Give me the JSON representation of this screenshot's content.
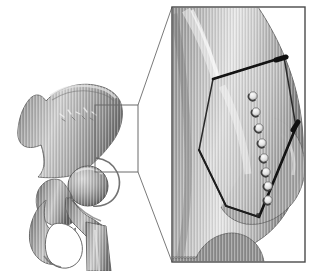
{
  "figure": {
    "title": "Periacetabular osteotomy of the hip",
    "background_color": "#ffffff",
    "width": 316,
    "height": 271,
    "panels": [
      {
        "id": "overview",
        "name": "pelvis-femur-overview",
        "caption": "Hemipelvis with proximal femur, lateral oblique view",
        "structures": [
          "ilium",
          "iliac-crest",
          "anterior-superior-iliac-spine",
          "acetabulum",
          "femoral-head",
          "femoral-neck",
          "greater-trochanter",
          "lesser-trochanter",
          "femoral-shaft",
          "ischium",
          "pubis",
          "obturator-foramen"
        ]
      },
      {
        "id": "magnified",
        "name": "osteotomy-detail-magnified",
        "caption": "Magnified acetabular region showing osteotomy cuts and drill holes",
        "structures": [
          "acetabular-fragment",
          "superior-osteotomy-cut",
          "inferior-osteotomy-cut",
          "drill-hole-row"
        ]
      }
    ]
  },
  "roi": {
    "label": "region-of-interest-box",
    "x": 95,
    "y": 105,
    "width": 43,
    "height": 67,
    "stroke": "#6a6a6a",
    "stroke_width": 1
  },
  "leader_lines": {
    "label": "magnification-leader-lines",
    "stroke": "#7a7a7a",
    "stroke_width": 1,
    "lines": [
      {
        "name": "leader-top",
        "x1": 138,
        "y1": 105,
        "x2": 172,
        "y2": 7
      },
      {
        "name": "leader-bottom",
        "x1": 138,
        "y1": 172,
        "x2": 172,
        "y2": 262
      }
    ]
  },
  "magnified_frame": {
    "label": "magnified-panel-frame",
    "x": 172,
    "y": 7,
    "width": 133,
    "height": 255,
    "stroke": "#4a4a4a",
    "stroke_width": 1.4,
    "fill": "#ffffff"
  },
  "bone_render": {
    "base_gray": "#9c9c9c",
    "highlight_gray": "#f0f0f0",
    "shadow_gray": "#5e5e5e",
    "outline_gray": "#6f6f6f",
    "striation_gray": "#b4b4b4",
    "striation_note": "fine vertical CT-style striations across bone surfaces"
  },
  "osteotomy": {
    "superior_cut": {
      "name": "superior-osteotomy-cut",
      "x1": 213,
      "y1": 79,
      "x2": 284,
      "y2": 57,
      "stroke": "#141414",
      "stroke_width": 2.6,
      "tip_note": "thickened blunt end at lateral margin"
    },
    "inferior_cut": {
      "name": "inferior-osteotomy-cut",
      "x1": 296,
      "y1": 127,
      "x2": 259,
      "y2": 217,
      "stroke": "#141414",
      "stroke_width": 2.6,
      "tip_note": "thickened blunt end at posterior margin"
    },
    "fragment_outline": {
      "name": "acetabular-fragment-outline",
      "stroke": "#2b2b2b",
      "stroke_width": 1.6,
      "points": "213,79 284,57 296,127 259,217 226,206 199,150"
    }
  },
  "drill_holes": {
    "label": "drill-hole-row",
    "count": 8,
    "fill": "#ededed",
    "rim": "#6b6b6b",
    "shadow": "#3f3f3f",
    "radius": 4.2,
    "positions": [
      {
        "index": 1,
        "cx": 253,
        "cy": 96
      },
      {
        "index": 2,
        "cx": 256,
        "cy": 112
      },
      {
        "index": 3,
        "cx": 259,
        "cy": 128
      },
      {
        "index": 4,
        "cx": 262,
        "cy": 143
      },
      {
        "index": 5,
        "cx": 264,
        "cy": 158
      },
      {
        "index": 6,
        "cx": 266,
        "cy": 172
      },
      {
        "index": 7,
        "cx": 268,
        "cy": 186
      },
      {
        "index": 8,
        "cx": 268,
        "cy": 200
      }
    ]
  },
  "pelvis_geometry": {
    "ilium_path": "M 46 101 C 40 92 33 94 28 101 C 22 109 19 119 18 129 C 17 137 19 143 24 146 C 30 149 36 147 41 145 C 43 151 44 157 44 162 C 44 168 42 173 38 177 C 46 178 55 178 63 177 C 74 176 83 172 90 166 C 97 160 104 153 110 145 C 115 139 119 132 121 124 C 123 116 123 108 120 101 C 116 93 108 88 99 86 C 88 83 76 84 66 88 C 58 91 51 95 46 101 Z",
    "iliac_crest_highlight": "M 52 95 C 62 88 75 85 88 86 C 99 87 109 91 115 98",
    "acetabulum_rim": "M 96 160 C 104 160 112 164 116 171 C 120 178 120 187 116 194 C 112 201 104 205 96 205",
    "femoral_head_cx": 88,
    "femoral_head_cy": 186,
    "femoral_head_r": 20,
    "femoral_neck_path": "M 74 196 C 78 206 84 213 92 217 L 104 234 L 88 244 L 74 226 C 66 218 62 207 63 196 Z",
    "greater_trochanter_path": "M 58 182 C 50 180 43 185 40 193 C 37 202 39 212 45 218 C 51 224 60 226 68 223",
    "femoral_shaft_path": "M 86 221 L 104 224 L 110 271 L 86 271 Z",
    "ischium_path": "M 44 205 C 38 212 34 222 33 232 C 32 241 35 249 41 254 C 47 259 55 259 61 255 C 66 251 69 244 69 237",
    "obturator_foramen_path": "M 56 226 C 66 224 76 230 80 240 C 84 250 81 260 73 265 C 65 269 55 266 50 258 C 45 250 47 233 56 226 Z"
  },
  "magnified_geometry": {
    "bone_mass_path": "M 172 7 L 255 7 C 268 24 280 44 288 66 C 296 88 301 112 302 136 C 303 160 299 183 290 202 C 281 221 267 235 250 244 C 236 251 220 255 205 256 L 172 256 Z",
    "lateral_bulge_path": "M 272 120 C 288 124 300 138 303 156 C 306 175 300 194 288 207 C 277 219 262 225 247 224 C 236 223 227 217 222 208",
    "inferior_notch_path": "M 196 238 C 206 226 220 220 234 222 C 246 224 256 232 261 243 C 264 250 265 256 264 262",
    "highlight_band_path": "M 196 16 C 206 42 214 70 219 99 C 224 128 226 158 225 187",
    "lower_bone_path": "M 172 256 L 195 256 C 201 244 210 236 221 233 C 232 230 244 233 252 241 C 258 247 261 254 262 262 L 172 262 Z"
  }
}
